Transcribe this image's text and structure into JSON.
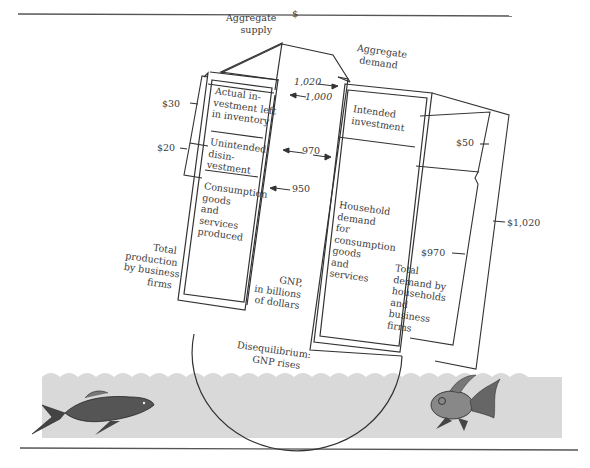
{
  "figure": {
    "arrow_head_symbol": "$",
    "aggregate_supply": {
      "label_line1": "Aggregate",
      "label_line2": "supply",
      "segments": [
        {
          "text_lines": [
            "Actual in-",
            "vestment left",
            "in inventory"
          ],
          "bracket_value": "$30"
        },
        {
          "text_lines": [
            "Unintended",
            "disin-",
            "vestment"
          ],
          "bracket_value": "$20"
        },
        {
          "text_lines": [
            "Consumption",
            "goods",
            "and",
            "services",
            "produced"
          ]
        }
      ],
      "side_label_lines": [
        "Total",
        "production",
        "by business",
        "firms"
      ]
    },
    "aggregate_demand": {
      "label_line1": "Aggregate",
      "label_line2": "demand",
      "segments": [
        {
          "text_lines": [
            "Intended",
            "investment"
          ],
          "bracket_value": "$50"
        },
        {
          "text_lines": [
            "Household",
            "demand",
            "for",
            "consumption",
            "goods",
            "and",
            "services"
          ],
          "bracket_value": "$970"
        }
      ],
      "side_label_lines": [
        "Total",
        "demand by",
        "households",
        "and",
        "business",
        "firms"
      ],
      "total_bracket_value": "$1,020"
    },
    "axis_markers": [
      "1,020",
      "1,000",
      "970",
      "950"
    ],
    "axis_label_lines": [
      "GNP,",
      "in billions",
      "of dollars"
    ],
    "bowl_label_lines": [
      "Disequilibrium:",
      "GNP rises"
    ],
    "water_color": "#d9d9d9",
    "fish": [
      "left-fish",
      "right-goldfish"
    ]
  }
}
